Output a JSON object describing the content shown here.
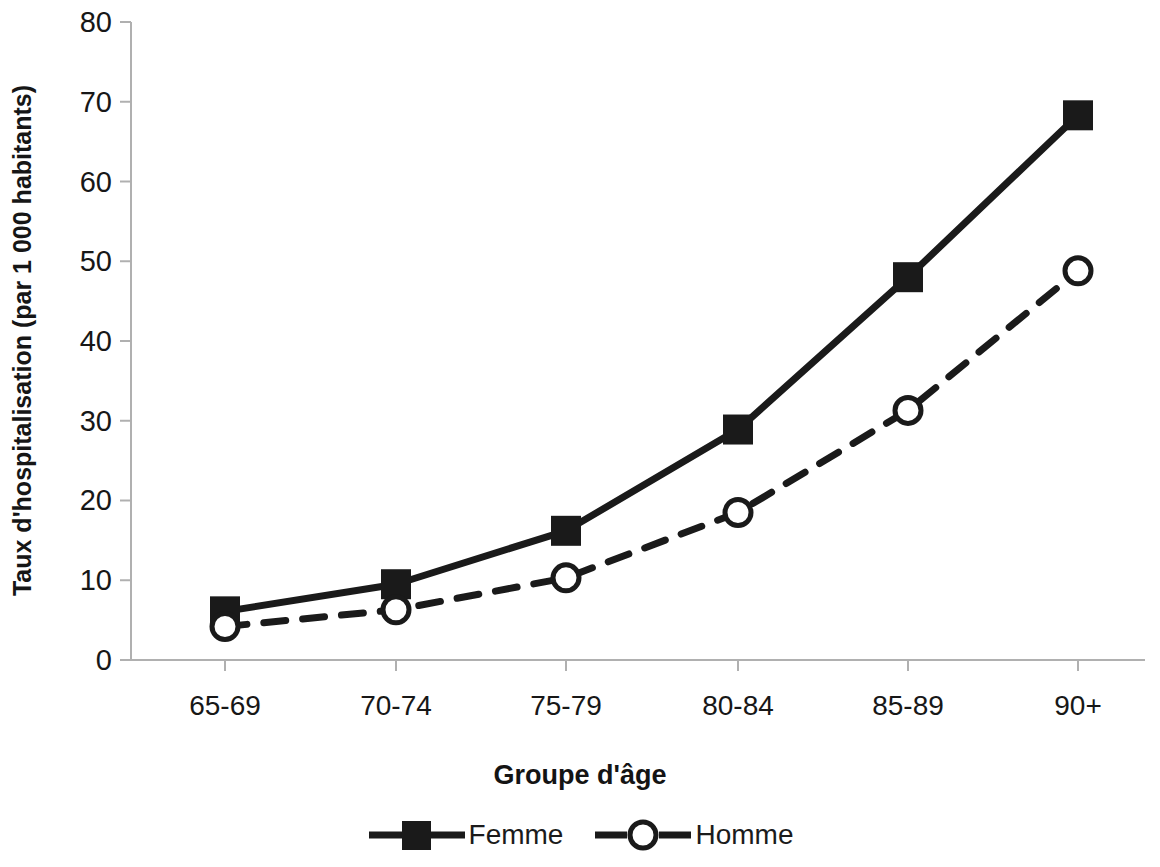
{
  "chart_data": {
    "type": "line",
    "title": "",
    "xlabel": "Groupe d'âge",
    "ylabel": "Taux d'hospitalisation (par 1 000 habitants)",
    "categories": [
      "65-69",
      "70-74",
      "75-79",
      "80-84",
      "85-89",
      "90+"
    ],
    "ylim": [
      0,
      80
    ],
    "yticks": [
      0,
      10,
      20,
      30,
      40,
      50,
      60,
      70,
      80
    ],
    "grid": false,
    "legend_position": "bottom",
    "series": [
      {
        "name": "Femme",
        "values": [
          6.1,
          9.5,
          16.2,
          28.9,
          48.0,
          68.3
        ],
        "marker": "filled-square",
        "line_style": "solid",
        "color": "#1a1a1a"
      },
      {
        "name": "Homme",
        "values": [
          4.2,
          6.3,
          10.3,
          18.5,
          31.3,
          48.8
        ],
        "marker": "open-circle",
        "line_style": "dashed",
        "color": "#1a1a1a"
      }
    ]
  },
  "axis": {
    "y_tick_labels": [
      "80",
      "70",
      "60",
      "50",
      "40",
      "30",
      "20",
      "10",
      "0"
    ],
    "x_tick_labels": [
      "65-69",
      "70-74",
      "75-79",
      "80-84",
      "85-89",
      "90+"
    ]
  },
  "legend": {
    "items": [
      {
        "label": "Femme"
      },
      {
        "label": "Homme"
      }
    ]
  },
  "colors": {
    "line": "#1a1a1a",
    "axis": "#b0b0b0",
    "text": "#171717",
    "background": "#ffffff"
  }
}
